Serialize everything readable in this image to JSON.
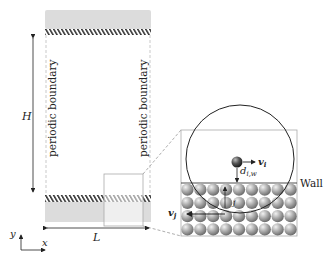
{
  "figure": {
    "labels": {
      "height": "H",
      "length": "L",
      "periodic_left": "periodic boundary",
      "periodic_right": "periodic boundary",
      "wall": "Wall",
      "v_i": "v",
      "v_i_sub": "i",
      "v_j": "v",
      "v_j_sub": "j",
      "d": "d",
      "d_sub": "i,w",
      "j": "j",
      "axis_y": "y",
      "axis_x": "x"
    },
    "colors": {
      "wall_fill": "#d9d9d9",
      "hatch": "#333333",
      "particle": "#9a9a9a",
      "line": "#222222"
    },
    "particle_grid": {
      "rows": 4,
      "cols": 9
    }
  }
}
